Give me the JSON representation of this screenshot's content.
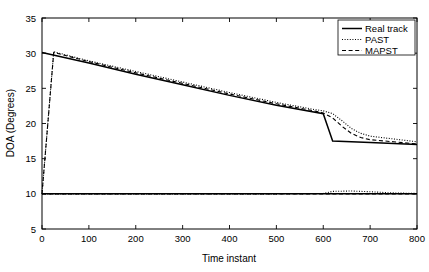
{
  "chart_data": {
    "type": "line",
    "title": "",
    "xlabel": "Time instant",
    "ylabel": "DOA (Degrees)",
    "xlim": [
      0,
      800
    ],
    "ylim": [
      5,
      35
    ],
    "xticks": [
      0,
      100,
      200,
      300,
      400,
      500,
      600,
      700,
      800
    ],
    "yticks": [
      5,
      10,
      15,
      20,
      25,
      30,
      35
    ],
    "xticklabels": [
      "0",
      "100",
      "200",
      "300",
      "400",
      "500",
      "600",
      "700",
      "800"
    ],
    "yticklabels": [
      "5",
      "10",
      "15",
      "20",
      "25",
      "30",
      "35"
    ],
    "grid": false,
    "legend_position": "upper right",
    "legend": [
      "Real track",
      "PAST",
      "MAPST"
    ],
    "series": [
      {
        "name": "Real track",
        "style": "solid",
        "color": "#000000",
        "target": "source-1",
        "x": [
          0,
          100,
          200,
          300,
          400,
          500,
          600,
          620,
          700,
          800
        ],
        "y": [
          30.1,
          28.6,
          27.0,
          25.5,
          24.0,
          22.6,
          21.4,
          17.5,
          17.3,
          17.0
        ]
      },
      {
        "name": "Real track",
        "style": "solid",
        "color": "#000000",
        "target": "source-2",
        "x": [
          0,
          100,
          200,
          300,
          400,
          500,
          600,
          700,
          800
        ],
        "y": [
          10.0,
          10.0,
          10.0,
          10.0,
          10.0,
          10.0,
          10.0,
          10.0,
          10.0
        ]
      },
      {
        "name": "PAST",
        "style": "dotted",
        "color": "#000000",
        "target": "source-1",
        "x": [
          0,
          25,
          100,
          200,
          300,
          400,
          500,
          580,
          600,
          620,
          640,
          660,
          680,
          700,
          750,
          800
        ],
        "y": [
          10.0,
          30.2,
          28.9,
          27.4,
          25.9,
          24.4,
          23.0,
          22.0,
          21.8,
          21.4,
          20.4,
          19.3,
          18.6,
          18.2,
          17.8,
          17.4
        ]
      },
      {
        "name": "PAST",
        "style": "dotted",
        "color": "#000000",
        "target": "source-2",
        "x": [
          0,
          100,
          200,
          300,
          400,
          500,
          600,
          620,
          660,
          700,
          740,
          800
        ],
        "y": [
          10.0,
          10.0,
          10.0,
          10.0,
          10.0,
          10.0,
          10.05,
          10.35,
          10.4,
          10.3,
          10.15,
          10.05
        ]
      },
      {
        "name": "MAPST",
        "style": "dashed",
        "color": "#000000",
        "target": "source-1",
        "x": [
          0,
          25,
          100,
          200,
          300,
          400,
          500,
          580,
          600,
          620,
          640,
          660,
          680,
          700,
          750,
          800
        ],
        "y": [
          10.0,
          30.1,
          28.8,
          27.2,
          25.7,
          24.2,
          22.8,
          21.8,
          21.5,
          20.8,
          19.6,
          18.6,
          18.0,
          17.7,
          17.4,
          17.1
        ]
      },
      {
        "name": "MAPST",
        "style": "dashed",
        "color": "#000000",
        "target": "source-2",
        "x": [
          0,
          100,
          200,
          300,
          400,
          500,
          600,
          700,
          800
        ],
        "y": [
          10.0,
          10.0,
          10.0,
          10.0,
          10.0,
          10.0,
          10.0,
          10.0,
          10.0
        ]
      }
    ]
  },
  "axes": {
    "xlabel": "Time instant",
    "ylabel": "DOA (Degrees)"
  },
  "legend": {
    "items": [
      {
        "label": "Real track",
        "style": "solid"
      },
      {
        "label": "PAST",
        "style": "dotted"
      },
      {
        "label": "MAPST",
        "style": "dashed"
      }
    ]
  },
  "xticklabels": [
    "0",
    "100",
    "200",
    "300",
    "400",
    "500",
    "600",
    "700",
    "800"
  ],
  "yticklabels": [
    "5",
    "10",
    "15",
    "20",
    "25",
    "30",
    "35"
  ]
}
